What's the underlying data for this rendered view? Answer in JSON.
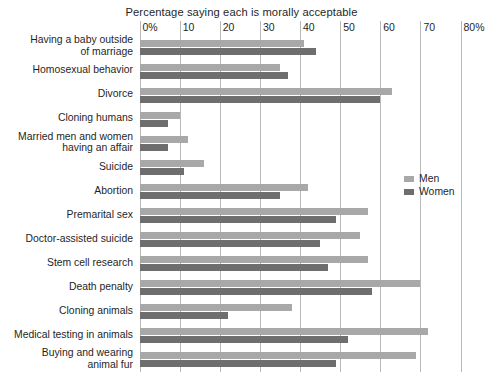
{
  "chart_data": {
    "type": "bar",
    "orientation": "horizontal",
    "title": "Percentage saying each is morally acceptable",
    "xlabel": "",
    "ylabel": "",
    "xlim": [
      0,
      80
    ],
    "xticks": [
      0,
      10,
      20,
      30,
      40,
      50,
      60,
      70,
      80
    ],
    "xtick_labels": [
      "0%",
      "10",
      "20",
      "30",
      "40",
      "50",
      "60",
      "70",
      "80%"
    ],
    "grid": "vertical",
    "legend_position": "right",
    "categories": [
      "Having a baby outside\nof marriage",
      "Homosexual behavior",
      "Divorce",
      "Cloning humans",
      "Married men and women\nhaving an affair",
      "Suicide",
      "Abortion",
      "Premarital sex",
      "Doctor-assisted suicide",
      "Stem cell research",
      "Death penalty",
      "Cloning animals",
      "Medical testing in animals",
      "Buying and wearing\nanimal fur"
    ],
    "series": [
      {
        "name": "Men",
        "color": "#a8a8a8",
        "values": [
          41,
          35,
          63,
          10,
          12,
          16,
          42,
          57,
          55,
          57,
          70,
          38,
          72,
          69
        ]
      },
      {
        "name": "Women",
        "color": "#6e6e6e",
        "values": [
          44,
          37,
          60,
          7,
          7,
          11,
          35,
          49,
          45,
          47,
          58,
          22,
          52,
          49
        ]
      }
    ]
  },
  "legend": {
    "items": [
      {
        "label": "Men",
        "color": "#a8a8a8"
      },
      {
        "label": "Women",
        "color": "#6e6e6e"
      }
    ]
  },
  "caption": ""
}
